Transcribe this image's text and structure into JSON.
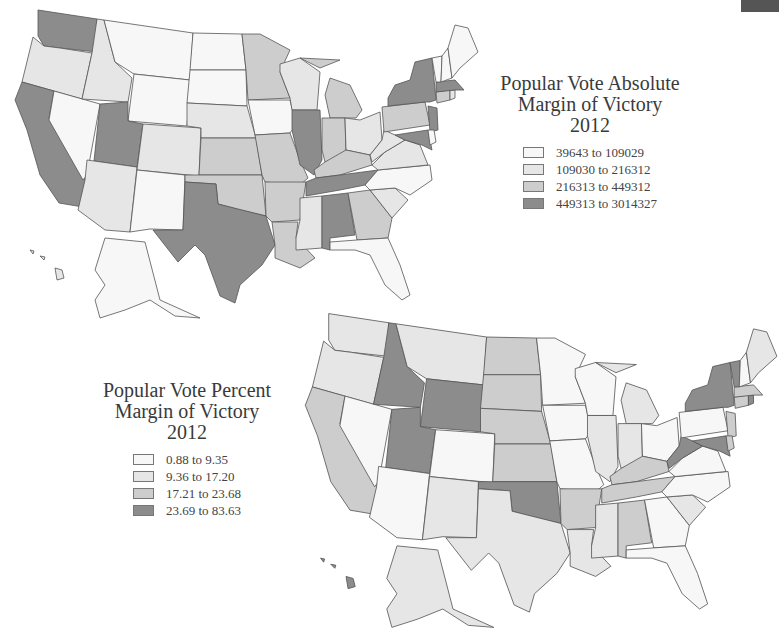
{
  "colors": {
    "class1": "#f7f7f7",
    "class2": "#e6e6e6",
    "class3": "#cdcdcd",
    "class4": "#8c8c8c",
    "outline": "#555555"
  },
  "map_absolute": {
    "title_line1": "Popular Vote Absolute",
    "title_line2": "Margin of Victory",
    "title_line3": "2012",
    "legend": [
      {
        "label": "39643 to 109029",
        "class": "class1"
      },
      {
        "label": "109030 to 216312",
        "class": "class2"
      },
      {
        "label": "216313 to 449312",
        "class": "class3"
      },
      {
        "label": "449313 to 3014327",
        "class": "class4"
      }
    ],
    "states": {
      "WA": 4,
      "OR": 2,
      "CA": 4,
      "NV": 1,
      "ID": 2,
      "MT": 1,
      "WY": 1,
      "UT": 4,
      "AZ": 2,
      "CO": 2,
      "NM": 1,
      "ND": 1,
      "SD": 1,
      "NE": 2,
      "KS": 3,
      "OK": 3,
      "TX": 4,
      "MN": 3,
      "IA": 1,
      "MO": 3,
      "AR": 3,
      "LA": 3,
      "WI": 2,
      "IL": 4,
      "MI": 3,
      "IN": 3,
      "OH": 2,
      "KY": 3,
      "TN": 4,
      "MS": 2,
      "AL": 4,
      "GA": 3,
      "FL": 1,
      "SC": 2,
      "NC": 1,
      "VA": 2,
      "WV": 2,
      "PA": 3,
      "NY": 4,
      "NJ": 4,
      "MD": 4,
      "DE": 1,
      "CT": 3,
      "RI": 2,
      "MA": 4,
      "VT": 1,
      "NH": 1,
      "ME": 1,
      "AK": 1,
      "HI": 2
    }
  },
  "map_percent": {
    "title_line1": "Popular Vote Percent",
    "title_line2": "Margin of Victory",
    "title_line3": "2012",
    "legend": [
      {
        "label": "0.88 to 9.35",
        "class": "class1"
      },
      {
        "label": "9.36 to 17.20",
        "class": "class2"
      },
      {
        "label": "17.21 to 23.68",
        "class": "class3"
      },
      {
        "label": "23.69 to 83.63",
        "class": "class4"
      }
    ],
    "states": {
      "WA": 2,
      "OR": 2,
      "CA": 3,
      "NV": 1,
      "ID": 4,
      "MT": 2,
      "WY": 4,
      "UT": 4,
      "AZ": 1,
      "CO": 1,
      "NM": 2,
      "ND": 3,
      "SD": 3,
      "NE": 3,
      "KS": 3,
      "OK": 4,
      "TX": 2,
      "MN": 1,
      "IA": 1,
      "MO": 1,
      "AR": 3,
      "LA": 2,
      "WI": 1,
      "IL": 2,
      "MI": 2,
      "IN": 2,
      "OH": 1,
      "KY": 3,
      "TN": 3,
      "MS": 2,
      "AL": 3,
      "GA": 1,
      "FL": 1,
      "SC": 2,
      "NC": 1,
      "VA": 1,
      "WV": 4,
      "PA": 1,
      "NY": 4,
      "NJ": 3,
      "MD": 4,
      "DE": 3,
      "CT": 3,
      "RI": 4,
      "MA": 3,
      "VT": 4,
      "NH": 1,
      "ME": 2,
      "AK": 2,
      "HI": 4
    }
  }
}
